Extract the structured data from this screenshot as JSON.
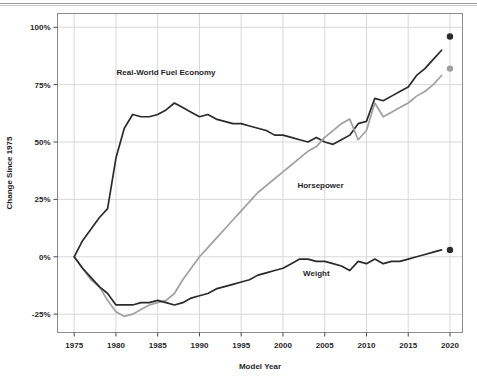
{
  "chart_data": {
    "type": "line",
    "title": "",
    "xlabel": "Model Year",
    "ylabel": "Change Since 1975",
    "xlim": [
      1973.0,
      2021.5
    ],
    "ylim": [
      -33,
      106
    ],
    "xticks": [
      1975,
      1980,
      1985,
      1990,
      1995,
      2000,
      2005,
      2010,
      2015,
      2020
    ],
    "xtick_labels": [
      "1975",
      "1980",
      "1985",
      "1990",
      "1995",
      "2000",
      "2005",
      "2010",
      "2015",
      "2020"
    ],
    "yticks": [
      -25,
      0,
      25,
      50,
      75,
      100
    ],
    "ytick_labels": [
      "-25%",
      "0%",
      "25%",
      "50%",
      "75%",
      "100%"
    ],
    "grid": true,
    "legend_position": "inline-annotations",
    "colors": {
      "fuel_economy": "#2b2b2b",
      "horsepower": "#a0a0a0",
      "weight": "#2b2b2b",
      "grid": "#d8d8d8",
      "frame": "#8c8c8c",
      "background": "#ffffff"
    },
    "annotations": [
      {
        "name": "fuel-economy-label",
        "text": "Real-World Fuel Economy",
        "x": 1986.0,
        "y": 79.0
      },
      {
        "name": "horsepower-label",
        "text": "Horsepower",
        "x": 2004.5,
        "y": 30.0
      },
      {
        "name": "weight-label",
        "text": "Weight",
        "x": 2004.0,
        "y": -8.5
      }
    ],
    "projected_points": [
      {
        "name": "fuel-economy-projected-point",
        "series": "Real-World Fuel Economy",
        "x": 2020,
        "y": 96,
        "color": "#2b2b2b"
      },
      {
        "name": "horsepower-projected-point",
        "series": "Horsepower",
        "x": 2020,
        "y": 82,
        "color": "#a0a0a0"
      },
      {
        "name": "weight-projected-point",
        "series": "Weight",
        "x": 2020,
        "y": 3,
        "color": "#2b2b2b"
      }
    ],
    "x": [
      1975,
      1976,
      1977,
      1978,
      1979,
      1980,
      1981,
      1982,
      1983,
      1984,
      1985,
      1986,
      1987,
      1988,
      1989,
      1990,
      1991,
      1992,
      1993,
      1994,
      1995,
      1996,
      1997,
      1998,
      1999,
      2000,
      2001,
      2002,
      2003,
      2004,
      2005,
      2006,
      2007,
      2008,
      2009,
      2010,
      2011,
      2012,
      2013,
      2014,
      2015,
      2016,
      2017,
      2018,
      2019
    ],
    "series": [
      {
        "name": "Real-World Fuel Economy",
        "color": "#2b2b2b",
        "values": [
          0,
          7,
          12,
          17,
          21,
          43,
          56,
          62,
          61,
          61,
          62,
          64,
          67,
          65,
          63,
          61,
          62,
          60,
          59,
          58,
          58,
          57,
          56,
          55,
          53,
          53,
          52,
          51,
          50,
          52,
          50,
          49,
          51,
          53,
          58,
          59,
          69,
          68,
          70,
          72,
          74,
          79,
          82,
          86,
          90
        ]
      },
      {
        "name": "Horsepower",
        "color": "#a0a0a0",
        "values": [
          0,
          -5,
          -10,
          -13,
          -19,
          -24,
          -26,
          -25,
          -23,
          -21,
          -20,
          -19,
          -16,
          -10,
          -5,
          0,
          4,
          8,
          12,
          16,
          20,
          24,
          28,
          31,
          34,
          37,
          40,
          43,
          46,
          48,
          52,
          55,
          58,
          60,
          51,
          55,
          67,
          61,
          63,
          65,
          67,
          70,
          72,
          75,
          79
        ]
      },
      {
        "name": "Weight",
        "color": "#2b2b2b",
        "values": [
          0,
          -5,
          -9,
          -13,
          -16,
          -21,
          -21,
          -21,
          -20,
          -20,
          -19,
          -20,
          -21,
          -20,
          -18,
          -17,
          -16,
          -14,
          -13,
          -12,
          -11,
          -10,
          -8,
          -7,
          -6,
          -5,
          -3,
          -1,
          -1,
          -2,
          -2,
          -3,
          -4,
          -6,
          -2,
          -3,
          -1,
          -3,
          -2,
          -2,
          -1,
          0,
          1,
          2,
          3
        ]
      }
    ]
  }
}
